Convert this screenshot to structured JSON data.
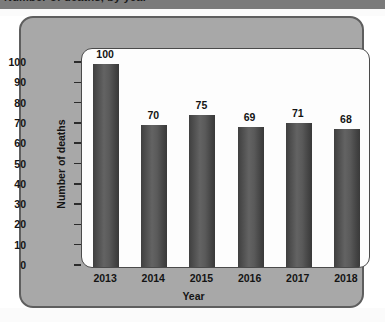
{
  "header": {
    "clipped_title": "Number of deaths, by year"
  },
  "chart_data": {
    "type": "bar",
    "title": "",
    "categories": [
      "2013",
      "2014",
      "2015",
      "2016",
      "2017",
      "2018"
    ],
    "values": [
      100,
      70,
      75,
      69,
      71,
      68
    ],
    "xlabel": "Year",
    "ylabel": "Number of deaths",
    "ylim": [
      0,
      100
    ],
    "y_ticks": [
      0,
      10,
      20,
      30,
      40,
      50,
      60,
      70,
      80,
      90,
      100
    ],
    "y_tick_labels": [
      "0",
      "10",
      "20",
      "30",
      "40",
      "50",
      "60",
      "70",
      "80",
      "90",
      "100"
    ],
    "value_labels": [
      "100",
      "70",
      "75",
      "69",
      "71",
      "68"
    ],
    "grid": false,
    "legend": null,
    "series": [
      {
        "name": "Number of deaths",
        "values": [
          100,
          70,
          75,
          69,
          71,
          68
        ]
      }
    ],
    "colors": {
      "bar_dark": "#3f3f3f",
      "bar_light": "#636363",
      "panel_background": "#a8a8a8",
      "panel_border": "#5e5e5e",
      "plot_background": "#fdfdfd",
      "plot_border": "#4a4a4a",
      "text": "#141414",
      "header_strip": "#7b7b7b"
    }
  }
}
